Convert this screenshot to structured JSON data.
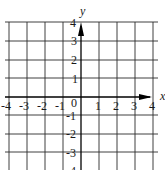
{
  "diagram": {
    "type": "coordinate-grid",
    "x_axis": {
      "label": "x",
      "min": -4,
      "max": 4,
      "ticks": [
        "-4",
        "-3",
        "-2",
        "-1",
        "1",
        "2",
        "3",
        "4"
      ]
    },
    "y_axis": {
      "label": "y",
      "min": -4,
      "max": 4,
      "ticks": [
        "4",
        "3",
        "2",
        "1",
        "-1",
        "-2",
        "-3",
        "-4"
      ]
    },
    "origin_label": "0",
    "grid": true,
    "colors": {
      "grid": "#2a2a2a",
      "axis": "#000000",
      "background": "#ffffff"
    }
  }
}
